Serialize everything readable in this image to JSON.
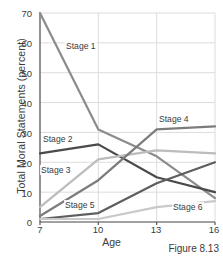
{
  "figure": {
    "caption": "Figure 8.13"
  },
  "chart_data": {
    "type": "line",
    "title": "",
    "xlabel": "Age",
    "ylabel": "Total Moral Statements (percent)",
    "x": [
      7,
      10,
      13,
      16
    ],
    "xticklabels": [
      "7",
      "10",
      "13",
      "16"
    ],
    "yticks": [
      0,
      10,
      20,
      30,
      40,
      50,
      60,
      70
    ],
    "yticklabels": [
      "0",
      "10",
      "20",
      "30",
      "40",
      "50",
      "60",
      "70"
    ],
    "xlim": [
      7,
      16
    ],
    "ylim": [
      0,
      70
    ],
    "grid": true,
    "legend": "inline-labels",
    "series": [
      {
        "name": "Stage 1",
        "values": [
          70,
          31,
          22,
          8
        ],
        "color": "#8c8c8c",
        "label_x": 65,
        "label_y": 41
      },
      {
        "name": "Stage 2",
        "values": [
          23,
          26,
          15,
          10
        ],
        "color": "#4a4a4a",
        "label_x": 42,
        "label_y": 134
      },
      {
        "name": "Stage 3",
        "values": [
          5,
          21,
          24,
          23
        ],
        "color": "#bcbcbc",
        "label_x": 40,
        "label_y": 165
      },
      {
        "name": "Stage 4",
        "values": [
          2,
          14,
          31,
          32
        ],
        "color": "#7c7c7c",
        "label_x": 158,
        "label_y": 114
      },
      {
        "name": "Stage 5",
        "values": [
          1,
          3,
          13,
          20
        ],
        "color": "#5e5e5e",
        "label_x": 64,
        "label_y": 200
      },
      {
        "name": "Stage 6",
        "values": [
          1,
          1,
          5,
          7
        ],
        "color": "#c9c9c9",
        "label_x": 172,
        "label_y": 202
      }
    ],
    "axis_color": "#555555",
    "grid_color": "#dcdcdc"
  }
}
